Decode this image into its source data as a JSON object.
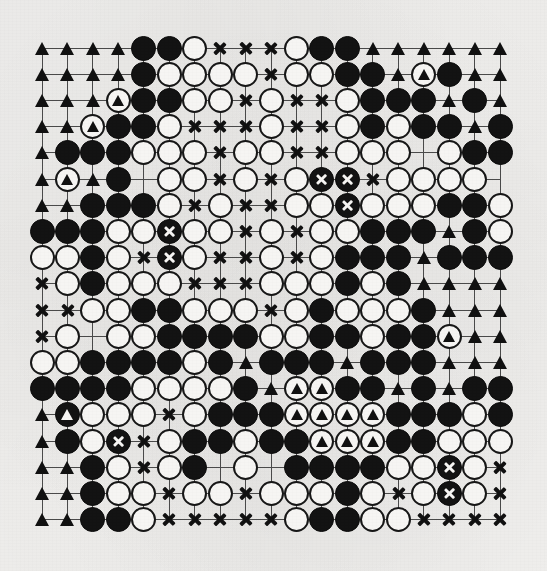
{
  "diagram": {
    "kind": "go-board-diagram",
    "board_size": 19,
    "legend": {
      "black_stone": "black stone",
      "white_stone": "white stone",
      "triangle_marker": "black territory point",
      "cross_marker": "white territory point",
      "marked_black_stone": "black stone marked with triangle",
      "marked_white_stone": "white stone marked with triangle",
      "dead_black_stone": "black stone marked dead with cross"
    },
    "colors": {
      "paper": "#f2f1ef",
      "black": "#131313",
      "white": "#f6f5f3",
      "line": "#4a4a4a",
      "ink": "#111111"
    },
    "geometry": {
      "origin_x": 42,
      "origin_y": 48,
      "step_x": 25.45,
      "step_y": 26.2
    },
    "hoshi": [
      [
        3,
        3
      ],
      [
        3,
        9
      ],
      [
        3,
        15
      ],
      [
        9,
        3
      ],
      [
        9,
        9
      ],
      [
        9,
        15
      ],
      [
        15,
        3
      ],
      [
        15,
        9
      ],
      [
        15,
        15
      ]
    ]
  },
  "chart_data": {
    "type": "table",
    "legend_keys": [
      "bt = black territory (triangle)",
      "wt = white territory (cross)",
      "b = black stone",
      "w = white stone",
      "bm = black stone + triangle",
      "wm = white stone + triangle",
      "bx = black stone + cross",
      "e = empty intersection"
    ],
    "rows": [
      [
        "bt",
        "bt",
        "bt",
        "bt",
        "b",
        "b",
        "w",
        "wt",
        "wt",
        "wt",
        "w",
        "b",
        "b",
        "bt",
        "bt",
        "bt",
        "bt",
        "bt",
        "bt"
      ],
      [
        "bt",
        "bt",
        "bt",
        "bt",
        "b",
        "w",
        "w",
        "w",
        "w",
        "wt",
        "w",
        "w",
        "b",
        "b",
        "bt",
        "wm",
        "b",
        "bt",
        "bt"
      ],
      [
        "bt",
        "bt",
        "bt",
        "wm",
        "b",
        "b",
        "w",
        "w",
        "wt",
        "w",
        "wt",
        "wt",
        "w",
        "b",
        "b",
        "b",
        "bt",
        "b",
        "bt"
      ],
      [
        "bt",
        "bt",
        "wm",
        "b",
        "b",
        "w",
        "wt",
        "wt",
        "wt",
        "w",
        "wt",
        "wt",
        "w",
        "b",
        "w",
        "b",
        "b",
        "bt",
        "b"
      ],
      [
        "bt",
        "b",
        "b",
        "b",
        "w",
        "w",
        "w",
        "wt",
        "w",
        "w",
        "wt",
        "wt",
        "w",
        "w",
        "w",
        "e",
        "w",
        "b",
        "b"
      ],
      [
        "bt",
        "wm",
        "bt",
        "b",
        "e",
        "w",
        "w",
        "wt",
        "w",
        "wt",
        "w",
        "bx",
        "bx",
        "wt",
        "w",
        "w",
        "w",
        "w",
        "e"
      ],
      [
        "bt",
        "bt",
        "b",
        "b",
        "b",
        "w",
        "wt",
        "w",
        "wt",
        "wt",
        "w",
        "w",
        "bx",
        "w",
        "w",
        "w",
        "b",
        "b",
        "w"
      ],
      [
        "b",
        "b",
        "b",
        "w",
        "w",
        "bx",
        "w",
        "w",
        "wt",
        "w",
        "wt",
        "w",
        "w",
        "b",
        "b",
        "b",
        "bt",
        "b",
        "w"
      ],
      [
        "w",
        "w",
        "b",
        "w",
        "wt",
        "bx",
        "w",
        "wt",
        "wt",
        "w",
        "wt",
        "w",
        "b",
        "b",
        "b",
        "bt",
        "b",
        "b",
        "b"
      ],
      [
        "wt",
        "w",
        "b",
        "w",
        "w",
        "w",
        "wt",
        "wt",
        "wt",
        "w",
        "w",
        "w",
        "b",
        "w",
        "b",
        "bt",
        "bt",
        "bt",
        "bt"
      ],
      [
        "wt",
        "wt",
        "w",
        "w",
        "b",
        "b",
        "w",
        "w",
        "w",
        "wt",
        "w",
        "b",
        "w",
        "w",
        "w",
        "b",
        "bt",
        "bt",
        "bt"
      ],
      [
        "wt",
        "w",
        "e",
        "w",
        "w",
        "b",
        "b",
        "b",
        "b",
        "w",
        "w",
        "b",
        "b",
        "w",
        "b",
        "b",
        "wm",
        "bt",
        "bt"
      ],
      [
        "w",
        "w",
        "b",
        "b",
        "b",
        "b",
        "w",
        "b",
        "bt",
        "b",
        "b",
        "b",
        "bt",
        "b",
        "b",
        "b",
        "bt",
        "bt",
        "bt"
      ],
      [
        "b",
        "b",
        "b",
        "b",
        "w",
        "w",
        "w",
        "w",
        "b",
        "bt",
        "wm",
        "wm",
        "b",
        "b",
        "bt",
        "b",
        "bt",
        "b",
        "b"
      ],
      [
        "bt",
        "bm",
        "w",
        "w",
        "w",
        "wt",
        "w",
        "b",
        "b",
        "b",
        "wm",
        "wm",
        "wm",
        "wm",
        "b",
        "b",
        "b",
        "w",
        "b"
      ],
      [
        "bt",
        "b",
        "w",
        "bx",
        "wt",
        "w",
        "b",
        "b",
        "w",
        "b",
        "b",
        "wm",
        "wm",
        "wm",
        "b",
        "b",
        "w",
        "w",
        "w"
      ],
      [
        "bt",
        "bt",
        "b",
        "w",
        "wt",
        "w",
        "b",
        "e",
        "w",
        "e",
        "b",
        "b",
        "b",
        "b",
        "w",
        "w",
        "bx",
        "w",
        "wt"
      ],
      [
        "bt",
        "bt",
        "b",
        "w",
        "w",
        "wt",
        "w",
        "w",
        "wt",
        "w",
        "w",
        "w",
        "b",
        "w",
        "wt",
        "w",
        "bx",
        "w",
        "wt"
      ],
      [
        "bt",
        "bt",
        "b",
        "b",
        "w",
        "wt",
        "wt",
        "wt",
        "wt",
        "wt",
        "w",
        "b",
        "b",
        "w",
        "w",
        "wt",
        "wt",
        "wt",
        "wt"
      ]
    ]
  }
}
